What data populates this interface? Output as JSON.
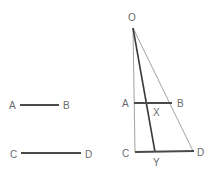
{
  "colors": {
    "thick": "#4a4a4a",
    "thin": "#8a8a8a",
    "label": "#6a6a6a"
  },
  "left_figure": {
    "segment_ab": {
      "label_start": "A",
      "label_end": "B"
    },
    "segment_cd": {
      "label_start": "C",
      "label_end": "D"
    }
  },
  "right_figure": {
    "apex_label": "O",
    "segment_ab": {
      "label_start": "A",
      "label_end": "B"
    },
    "segment_cd": {
      "label_start": "C",
      "label_end": "D"
    },
    "intersection_x": "X",
    "intersection_y": "Y"
  }
}
